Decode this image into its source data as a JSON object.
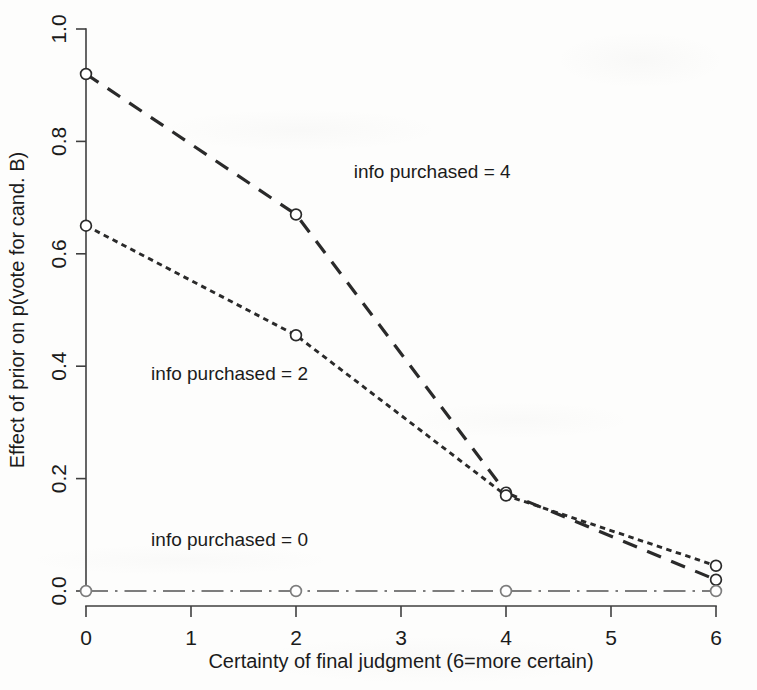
{
  "chart_data": {
    "type": "line",
    "title": "",
    "xlabel": "Certainty of final judgment (6=more certain)",
    "ylabel": "Effect of prior on p(vote for cand. B)",
    "x": [
      0,
      2,
      4,
      6
    ],
    "xlim": [
      0,
      6
    ],
    "ylim": [
      0.0,
      1.0
    ],
    "xticks": [
      "0",
      "1",
      "2",
      "3",
      "4",
      "5",
      "6"
    ],
    "xtick_values": [
      0,
      1,
      2,
      3,
      4,
      5,
      6
    ],
    "yticks": [
      "0.0",
      "0.2",
      "0.4",
      "0.6",
      "0.8",
      "1.0"
    ],
    "ytick_values": [
      0.0,
      0.2,
      0.4,
      0.6,
      0.8,
      1.0
    ],
    "grid": false,
    "legend_position": "inline-annotations",
    "series": [
      {
        "name": "info purchased = 4",
        "values": [
          0.92,
          0.67,
          0.175,
          0.02
        ],
        "dash": "long-dash",
        "color": "#2a2a2a",
        "label_x": 2.55,
        "label_y": 0.735
      },
      {
        "name": "info purchased = 2",
        "values": [
          0.65,
          0.455,
          0.17,
          0.045
        ],
        "dash": "short-dash",
        "color": "#2a2a2a",
        "label_x": 0.62,
        "label_y": 0.375
      },
      {
        "name": "info purchased = 0",
        "values": [
          0.0,
          0.0,
          0.0,
          0.0
        ],
        "dash": "dash-dot",
        "color": "#7d7d7d",
        "label_x": 0.62,
        "label_y": 0.08
      }
    ]
  }
}
